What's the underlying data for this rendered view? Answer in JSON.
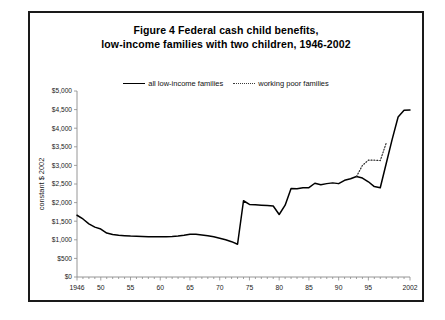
{
  "figure": {
    "title_line1": "Figure 4   Federal cash child benefits,",
    "title_line2": "low-income families with two children, 1946-2002"
  },
  "chart_data": {
    "type": "line",
    "title": "Figure 4   Federal cash child benefits, low-income families with two children, 1946-2002",
    "xlabel": "",
    "ylabel": "constant $ 2002",
    "xlim": [
      1946,
      2002
    ],
    "ylim": [
      0,
      5000
    ],
    "grid": false,
    "legend_position": "top-center",
    "ytick_labels": [
      "$5,000",
      "$4,500",
      "$4,000",
      "$3,500",
      "$3,000",
      "$2,500",
      "$2,000",
      "$1,500",
      "$1,000",
      "$500",
      "$0"
    ],
    "ytick_values": [
      5000,
      4500,
      4000,
      3500,
      3000,
      2500,
      2000,
      1500,
      1000,
      500,
      0
    ],
    "xtick_labels": [
      "1946",
      "50",
      "55",
      "60",
      "65",
      "70",
      "75",
      "80",
      "85",
      "90",
      "95",
      "2002"
    ],
    "xtick_values": [
      1946,
      1950,
      1955,
      1960,
      1965,
      1970,
      1975,
      1980,
      1985,
      1990,
      1995,
      2002
    ],
    "series": [
      {
        "name": "all low-income families",
        "style": "solid",
        "color": "#000000",
        "x": [
          1946,
          1947,
          1948,
          1949,
          1950,
          1951,
          1952,
          1953,
          1954,
          1955,
          1956,
          1957,
          1958,
          1959,
          1960,
          1961,
          1962,
          1963,
          1964,
          1965,
          1966,
          1967,
          1968,
          1969,
          1970,
          1971,
          1972,
          1973,
          1974,
          1975,
          1976,
          1977,
          1978,
          1979,
          1980,
          1981,
          1982,
          1983,
          1984,
          1985,
          1986,
          1987,
          1988,
          1989,
          1990,
          1991,
          1992,
          1993,
          1994,
          1995,
          1996,
          1997,
          1998,
          1999,
          2000,
          2001,
          2002
        ],
        "y": [
          1660,
          1560,
          1430,
          1340,
          1290,
          1180,
          1140,
          1120,
          1110,
          1100,
          1095,
          1090,
          1085,
          1080,
          1080,
          1085,
          1090,
          1100,
          1120,
          1150,
          1150,
          1130,
          1110,
          1080,
          1040,
          1000,
          950,
          880,
          2050,
          1950,
          1940,
          1930,
          1920,
          1910,
          1680,
          1930,
          2380,
          2370,
          2400,
          2400,
          2520,
          2480,
          2510,
          2530,
          2510,
          2600,
          2640,
          2700,
          2660,
          2560,
          2430,
          2400,
          3050,
          3700,
          4300,
          4480,
          4490
        ]
      },
      {
        "name": "working poor families",
        "style": "dotted",
        "color": "#2b2b2b",
        "x": [
          1993,
          1994,
          1995,
          1996,
          1997,
          1998
        ],
        "y": [
          2700,
          3000,
          3140,
          3140,
          3130,
          3600
        ]
      }
    ]
  },
  "legend": {
    "entries": [
      {
        "label": "all low-income families",
        "style": "solid"
      },
      {
        "label": "working poor families",
        "style": "dotted"
      }
    ]
  },
  "axes": {
    "y_axis_title": "constant $ 2002"
  }
}
